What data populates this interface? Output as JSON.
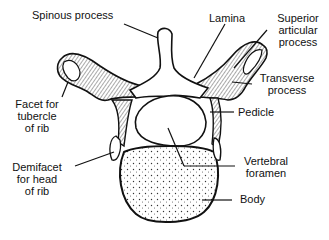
{
  "diagram": {
    "labels": {
      "spinous_process": "Spinous process",
      "lamina": "Lamina",
      "superior_articular_1": "Superior",
      "superior_articular_2": "articular",
      "superior_articular_3": "process",
      "transverse_1": "Transverse",
      "transverse_2": "process",
      "pedicle": "Pedicle",
      "facet_tubercle_1": "Facet for",
      "facet_tubercle_2": "tubercle",
      "facet_tubercle_3": "of rib",
      "demifacet_1": "Demifacet",
      "demifacet_2": "for head",
      "demifacet_3": "of rib",
      "vertebral_foramen_1": "Vertebral",
      "vertebral_foramen_2": "foramen",
      "body": "Body"
    },
    "colors": {
      "ink": "#111111",
      "bone_fill": "#ffffff",
      "shade": "#7a7a7a"
    }
  }
}
